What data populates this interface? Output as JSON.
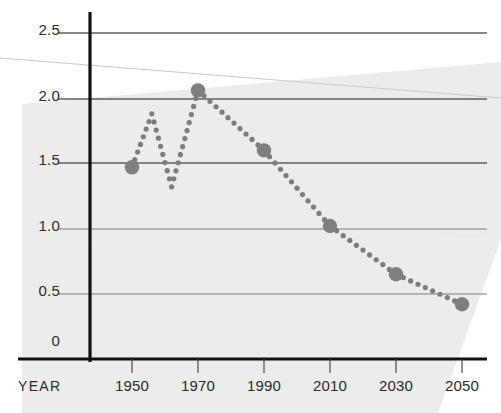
{
  "chart_data": {
    "type": "line",
    "title": "",
    "subtitle": "",
    "xlabel": "YEAR",
    "ylabel": "",
    "x": [
      1950,
      1956,
      1962,
      1970,
      1990,
      2010,
      2030,
      2050
    ],
    "values": [
      1.47,
      1.88,
      1.32,
      2.06,
      1.6,
      1.02,
      0.65,
      0.42
    ],
    "markers": [
      {
        "x": 1950,
        "y": 1.47,
        "emphasis": true
      },
      {
        "x": 1956,
        "y": 1.88,
        "emphasis": false
      },
      {
        "x": 1962,
        "y": 1.32,
        "emphasis": false
      },
      {
        "x": 1970,
        "y": 2.06,
        "emphasis": true
      },
      {
        "x": 1990,
        "y": 1.6,
        "emphasis": true
      },
      {
        "x": 2010,
        "y": 1.02,
        "emphasis": true
      },
      {
        "x": 2030,
        "y": 0.65,
        "emphasis": true
      },
      {
        "x": 2050,
        "y": 0.42,
        "emphasis": true
      }
    ],
    "xlim": [
      1930,
      2070
    ],
    "ylim": [
      0,
      2.5
    ],
    "xticks": [
      1950,
      1970,
      1990,
      2010,
      2030,
      2050
    ],
    "xticklabels": [
      "1950",
      "1970",
      "1990",
      "2010",
      "2030",
      "2050"
    ],
    "yticks": [
      0,
      0.5,
      1.0,
      1.5,
      2.0,
      2.5
    ],
    "yticklabels": [
      "0",
      "0.5",
      "1.0",
      "1.5",
      "2.0",
      "2.5"
    ],
    "grid": true,
    "grid_axis": "y",
    "legend": null,
    "line_style": "dotted",
    "series_color": "#7d7d7d",
    "marker_color": "#7f7f7f",
    "gridline_color": "#6e6e6e",
    "axis_color": "#1a1a1a",
    "background_band_color": "#e9e9e9"
  },
  "axes": {
    "y_axis_name": "value-axis",
    "x_axis_name": "year-axis"
  }
}
